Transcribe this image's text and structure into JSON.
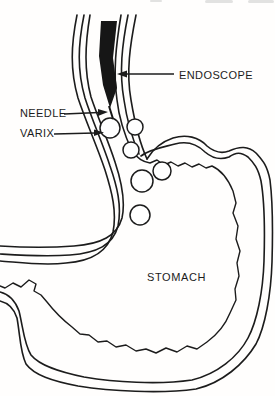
{
  "figure": {
    "type": "medical line illustration",
    "labels": {
      "endoscope": "ENDOSCOPE",
      "needle": "NEEDLE",
      "varix": "VARIX",
      "stomach": "STOMACH"
    },
    "colors": {
      "background": "#fffefd",
      "line": "#1c1c1c",
      "endoscope_fill": "#161616",
      "edge_artifact": "#b9b9b9"
    }
  }
}
